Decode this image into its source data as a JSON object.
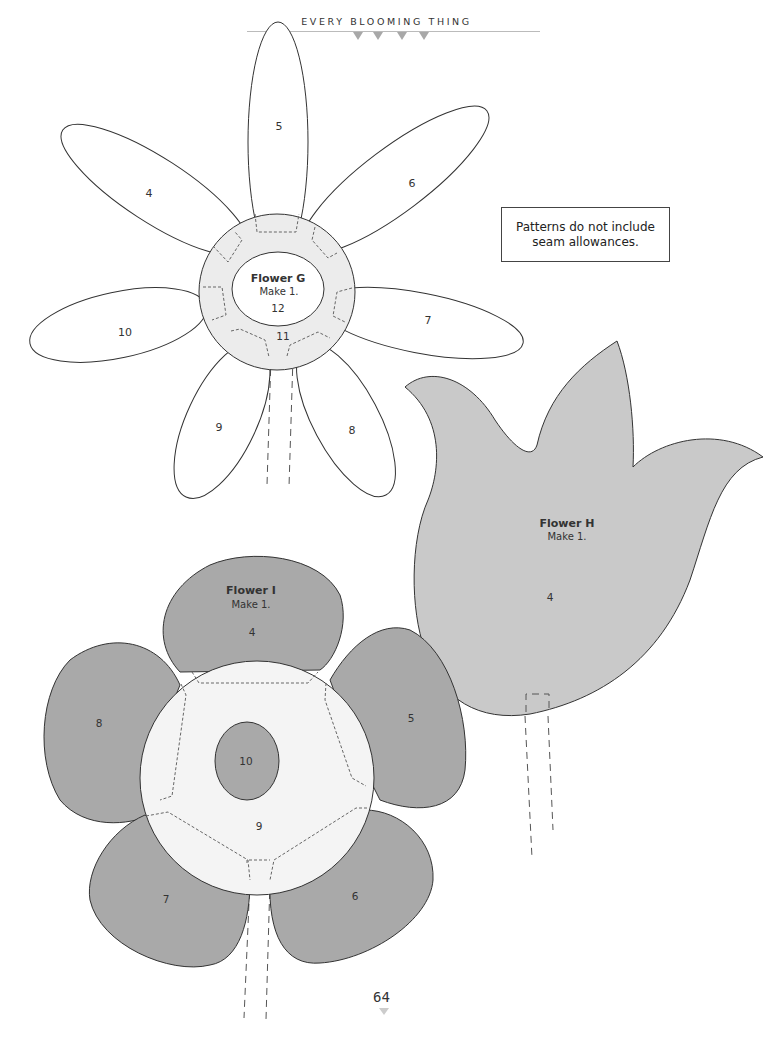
{
  "header": {
    "title": "EVERY BLOOMING THING",
    "decor_triangles": 4,
    "accent_color": "#a8a8a8"
  },
  "note": {
    "line1": "Patterns do not include",
    "line2": "seam allowances."
  },
  "flowers": {
    "g": {
      "name": "Flower G",
      "instruction": "Make 1.",
      "center_piece": "12",
      "ring_piece": "11",
      "petals": [
        "4",
        "5",
        "6",
        "7",
        "8",
        "9",
        "10"
      ],
      "petal_fill": "#ffffff",
      "ring_fill": "#ececec"
    },
    "h": {
      "name": "Flower H",
      "instruction": "Make 1.",
      "piece": "4",
      "fill": "#c9c9c9"
    },
    "i": {
      "name": "Flower I",
      "instruction": "Make 1.",
      "center_piece": "10",
      "ring_piece": "9",
      "petals": [
        "4",
        "5",
        "6",
        "7",
        "8"
      ],
      "petal_fill": "#a9a9a9",
      "ring_fill": "#f4f4f4"
    }
  },
  "footer": {
    "page_number": "64"
  }
}
